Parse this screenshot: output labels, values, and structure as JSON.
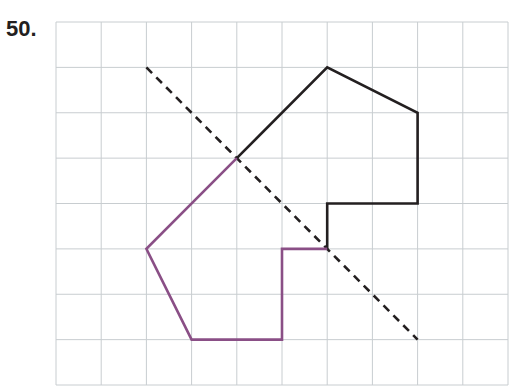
{
  "problem": {
    "number_label": "50."
  },
  "grid": {
    "columns": 10,
    "rows": 8,
    "origin_px": [
      56,
      22
    ],
    "cell_w": 45.2,
    "cell_h": 45.375,
    "line_color": "#c8cdd0"
  },
  "line_of_reflection": {
    "style": "dashed",
    "color": "#231f20",
    "points": [
      [
        2,
        1
      ],
      [
        8,
        7
      ]
    ]
  },
  "shapes": [
    {
      "name": "original",
      "color": "#231f20",
      "points": [
        [
          4,
          3
        ],
        [
          6,
          1
        ],
        [
          8,
          2
        ],
        [
          8,
          4
        ],
        [
          6,
          4
        ],
        [
          6,
          5
        ]
      ]
    },
    {
      "name": "reflection",
      "color": "#8a4f86",
      "points": [
        [
          4,
          3
        ],
        [
          2,
          5
        ],
        [
          3,
          7
        ],
        [
          5,
          7
        ],
        [
          5,
          5
        ],
        [
          6,
          5
        ]
      ]
    }
  ]
}
